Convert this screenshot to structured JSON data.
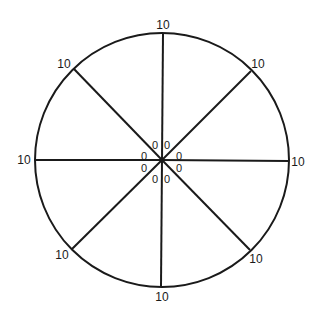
{
  "diagram": {
    "type": "radial-wheel",
    "center": {
      "x": 162,
      "y": 160
    },
    "radius": 127,
    "stroke_color": "#1a1a1a",
    "spokes": [
      {
        "name": "top",
        "end": {
          "x": 163,
          "y": 34
        },
        "outer_label": "10",
        "outer_pos": {
          "x": 163,
          "y": 29
        },
        "inner_label": "0",
        "inner_pos": {
          "x": 167,
          "y": 146
        }
      },
      {
        "name": "top-right",
        "end": {
          "x": 251,
          "y": 71
        },
        "outer_label": "10",
        "outer_pos": {
          "x": 258,
          "y": 68
        },
        "inner_label": "0",
        "inner_pos": {
          "x": 179,
          "y": 157
        }
      },
      {
        "name": "right",
        "end": {
          "x": 288,
          "y": 161
        },
        "outer_label": "10",
        "outer_pos": {
          "x": 298,
          "y": 166
        },
        "inner_label": "0",
        "inner_pos": {
          "x": 179,
          "y": 169
        }
      },
      {
        "name": "bottom-right",
        "end": {
          "x": 250,
          "y": 250
        },
        "outer_label": "10",
        "outer_pos": {
          "x": 256,
          "y": 263
        },
        "inner_label": "0",
        "inner_pos": {
          "x": 167,
          "y": 180
        }
      },
      {
        "name": "bottom",
        "end": {
          "x": 161,
          "y": 286
        },
        "outer_label": "10",
        "outer_pos": {
          "x": 162,
          "y": 301
        },
        "inner_label": "0",
        "inner_pos": {
          "x": 155,
          "y": 180
        }
      },
      {
        "name": "bottom-left",
        "end": {
          "x": 72,
          "y": 249
        },
        "outer_label": "10",
        "outer_pos": {
          "x": 62,
          "y": 259
        },
        "inner_label": "0",
        "inner_pos": {
          "x": 144,
          "y": 169
        }
      },
      {
        "name": "left",
        "end": {
          "x": 36,
          "y": 160
        },
        "outer_label": "10",
        "outer_pos": {
          "x": 24,
          "y": 164
        },
        "inner_label": "0",
        "inner_pos": {
          "x": 144,
          "y": 157
        }
      },
      {
        "name": "top-left",
        "end": {
          "x": 74,
          "y": 69
        },
        "outer_label": "10",
        "outer_pos": {
          "x": 64,
          "y": 68
        },
        "inner_label": "0",
        "inner_pos": {
          "x": 155,
          "y": 146
        }
      }
    ]
  }
}
